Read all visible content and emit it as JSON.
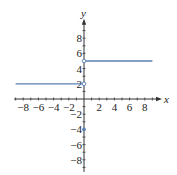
{
  "chart_data": {
    "type": "line",
    "title": "",
    "xlabel": "x",
    "ylabel": "y",
    "xlim": [
      -9,
      9
    ],
    "ylim": [
      -9,
      9
    ],
    "x_ticks": [
      -8,
      -6,
      -4,
      -2,
      2,
      4,
      6,
      8
    ],
    "y_ticks": [
      8,
      6,
      4,
      2,
      -2,
      -4,
      -6,
      -8
    ],
    "x_tick_labels": [
      "−8",
      "−6",
      "−4",
      "−2",
      "2",
      "4",
      "6",
      "8"
    ],
    "y_tick_labels": [
      "8",
      "6",
      "4",
      "2",
      "−2",
      "−4",
      "−6",
      "−8"
    ],
    "grid": false,
    "series": [
      {
        "name": "segment-left",
        "x": [
          -9,
          0
        ],
        "y": [
          2,
          2
        ],
        "end_marker": "open"
      },
      {
        "name": "segment-right",
        "x": [
          0,
          9
        ],
        "y": [
          5,
          5
        ],
        "start_marker": "open"
      },
      {
        "name": "point",
        "x": [
          0
        ],
        "y": [
          -4
        ],
        "marker": "filled"
      }
    ],
    "line_color": "#5b7fb5"
  },
  "axes": {
    "x_label": "x",
    "y_label": "y"
  }
}
